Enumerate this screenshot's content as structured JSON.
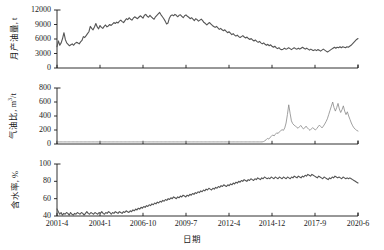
{
  "figure": {
    "background_color": "#ffffff",
    "line_color": "#555555",
    "axis_color": "#1a1a1a",
    "width": 384,
    "height": 250
  },
  "axis": {
    "xlabel": "日期",
    "xticks": [
      "2001-4",
      "2004-1",
      "2006-10",
      "2009-7",
      "2012-4",
      "2014-12",
      "2017-9",
      "2020-6"
    ]
  },
  "chart_data": [
    {
      "type": "line",
      "panel": 1,
      "title": "",
      "xlabel": "日期",
      "ylabel": "月产油量, t",
      "ylabel_text": "月产油量",
      "ylabel_unit": "t",
      "xlim": [
        "2001-4",
        "2020-6"
      ],
      "ylim": [
        0,
        12000
      ],
      "yticks": [
        "0",
        "3000",
        "6000",
        "9000",
        "12000"
      ],
      "ytick_values": [
        0,
        3000,
        6000,
        9000,
        12000
      ],
      "grid": false,
      "legend": "none",
      "series": [
        {
          "name": "月产油量",
          "color": "#555555",
          "values": [
            4400,
            5600,
            4700,
            5200,
            6100,
            7300,
            5900,
            5200,
            4900,
            4600,
            4800,
            5000,
            4700,
            5100,
            5300,
            5200,
            5000,
            5400,
            5700,
            6500,
            6300,
            6700,
            7100,
            7500,
            8600,
            8200,
            7900,
            8500,
            9200,
            8500,
            8100,
            8800,
            8400,
            8200,
            8600,
            8900,
            8500,
            8700,
            9000,
            8800,
            9100,
            9400,
            9200,
            9500,
            9300,
            9700,
            9900,
            9600,
            9400,
            9800,
            10200,
            10000,
            10400,
            10100,
            9900,
            10300,
            10600,
            10400,
            10200,
            10500,
            10800,
            10600,
            10300,
            10900,
            11100,
            10700,
            10500,
            10900,
            10600,
            10300,
            10100,
            10600,
            10900,
            11200,
            11500,
            11000,
            10600,
            10200,
            9700,
            9100,
            9300,
            10300,
            10800,
            11000,
            10800,
            11100,
            10900,
            10600,
            10900,
            11000,
            10700,
            10400,
            10800,
            11000,
            10700,
            10500,
            10200,
            10400,
            10100,
            9800,
            10200,
            10000,
            9700,
            9900,
            10100,
            9800,
            9400,
            9200,
            8900,
            9200,
            9400,
            9100,
            8800,
            8600,
            8400,
            8600,
            8300,
            8000,
            8200,
            7900,
            7700,
            7900,
            7600,
            7300,
            7500,
            7200,
            6900,
            7100,
            6800,
            6600,
            6800,
            6500,
            6300,
            6500,
            6700,
            6400,
            6200,
            6400,
            6100,
            5900,
            6100,
            5800,
            5600,
            5800,
            5500,
            5300,
            5500,
            5200,
            5000,
            5200,
            4900,
            4700,
            4900,
            4600,
            4800,
            4500,
            4300,
            4500,
            4200,
            4000,
            4200,
            3900,
            3800,
            3900,
            4100,
            3900,
            4000,
            4200,
            4000,
            3800,
            4000,
            4200,
            4000,
            3900,
            4100,
            3900,
            4100,
            4300,
            4100,
            3900,
            4100,
            3900,
            3700,
            3900,
            3700,
            3600,
            3800,
            3600,
            3800,
            3700,
            3500,
            3700,
            3900,
            3700,
            3500,
            3300,
            3500,
            3700,
            3900,
            4100,
            4300,
            4100,
            4300,
            4200,
            4400,
            4200,
            4400,
            4300,
            4200,
            4400,
            4300,
            4500,
            4700,
            5000,
            5300,
            5600,
            5900,
            6100
          ]
        }
      ]
    },
    {
      "type": "line",
      "panel": 2,
      "title": "",
      "xlabel": "日期",
      "ylabel": "气油比, m3/t",
      "ylabel_text": "气油比",
      "ylabel_unit": "m3/t",
      "xlim": [
        "2001-4",
        "2020-6"
      ],
      "ylim": [
        0,
        800
      ],
      "yticks": [
        "0",
        "200",
        "400",
        "600",
        "800"
      ],
      "ytick_values": [
        0,
        200,
        400,
        600,
        800
      ],
      "grid": false,
      "legend": "none",
      "series": [
        {
          "name": "气油比",
          "color": "#888888",
          "values": [
            30,
            30,
            30,
            30,
            30,
            30,
            30,
            30,
            30,
            30,
            30,
            30,
            30,
            30,
            30,
            30,
            30,
            30,
            30,
            30,
            30,
            30,
            30,
            30,
            30,
            30,
            30,
            30,
            30,
            30,
            30,
            30,
            30,
            30,
            30,
            30,
            30,
            30,
            30,
            30,
            30,
            30,
            30,
            30,
            30,
            30,
            30,
            30,
            30,
            30,
            30,
            30,
            30,
            30,
            30,
            30,
            30,
            30,
            30,
            30,
            30,
            30,
            30,
            30,
            30,
            30,
            30,
            30,
            30,
            30,
            30,
            30,
            30,
            30,
            30,
            30,
            30,
            30,
            30,
            30,
            30,
            30,
            30,
            30,
            30,
            30,
            30,
            30,
            30,
            30,
            30,
            30,
            30,
            30,
            30,
            30,
            30,
            30,
            30,
            30,
            30,
            30,
            30,
            30,
            30,
            30,
            30,
            30,
            30,
            30,
            30,
            30,
            30,
            30,
            30,
            30,
            30,
            30,
            30,
            30,
            30,
            30,
            30,
            30,
            30,
            30,
            30,
            30,
            30,
            30,
            30,
            30,
            30,
            30,
            30,
            30,
            30,
            30,
            30,
            30,
            30,
            30,
            30,
            30,
            30,
            30,
            30,
            30,
            30,
            30,
            30,
            30,
            30,
            30,
            30,
            35,
            45,
            60,
            80,
            70,
            95,
            110,
            130,
            115,
            140,
            160,
            150,
            175,
            190,
            205,
            195,
            230,
            300,
            420,
            560,
            440,
            330,
            290,
            270,
            255,
            240,
            225,
            245,
            265,
            240,
            215,
            230,
            255,
            230,
            210,
            195,
            215,
            235,
            215,
            200,
            220,
            245,
            270,
            250,
            230,
            255,
            285,
            320,
            360,
            420,
            480,
            540,
            600,
            520,
            470,
            520,
            580,
            500,
            450,
            490,
            545,
            470,
            420,
            460,
            400,
            350,
            300,
            260,
            230,
            210,
            195,
            185
          ]
        }
      ]
    },
    {
      "type": "line",
      "panel": 3,
      "title": "",
      "xlabel": "日期",
      "ylabel": "含水率, %",
      "ylabel_text": "含水率",
      "ylabel_unit": "%",
      "xlim": [
        "2001-4",
        "2020-6"
      ],
      "ylim": [
        40,
        100
      ],
      "yticks": [
        "40",
        "60",
        "80",
        "100"
      ],
      "ytick_values": [
        40,
        60,
        80,
        100
      ],
      "grid": false,
      "legend": "none",
      "series": [
        {
          "name": "含水率",
          "color": "#555555",
          "values": [
            48,
            45,
            42,
            44,
            41,
            43,
            42,
            44,
            43,
            41,
            44,
            42,
            41,
            43,
            42,
            44,
            43,
            42,
            44,
            43,
            41,
            43,
            45,
            43,
            42,
            44,
            43,
            42,
            44,
            43,
            42,
            44,
            43,
            45,
            43,
            42,
            44,
            43,
            45,
            44,
            42,
            44,
            43,
            45,
            44,
            43,
            45,
            44,
            43,
            45,
            44,
            46,
            45,
            44,
            46,
            45,
            47,
            46,
            48,
            47,
            49,
            48,
            50,
            49,
            51,
            50,
            52,
            51,
            53,
            52,
            54,
            53,
            55,
            54,
            56,
            55,
            57,
            56,
            58,
            57,
            59,
            58,
            60,
            59,
            61,
            60,
            62,
            61,
            60,
            62,
            61,
            63,
            62,
            64,
            63,
            62,
            64,
            63,
            65,
            64,
            66,
            65,
            67,
            66,
            68,
            67,
            69,
            68,
            70,
            69,
            71,
            70,
            72,
            71,
            70,
            72,
            71,
            73,
            72,
            74,
            73,
            75,
            74,
            76,
            75,
            74,
            76,
            75,
            77,
            76,
            78,
            77,
            79,
            78,
            80,
            79,
            81,
            80,
            82,
            81,
            80,
            82,
            81,
            83,
            82,
            81,
            83,
            82,
            84,
            83,
            82,
            84,
            83,
            85,
            84,
            83,
            84,
            83,
            85,
            84,
            83,
            85,
            84,
            83,
            85,
            84,
            83,
            85,
            84,
            83,
            85,
            84,
            83,
            85,
            84,
            86,
            85,
            84,
            86,
            85,
            84,
            86,
            85,
            87,
            86,
            88,
            87,
            86,
            88,
            87,
            86,
            85,
            84,
            86,
            85,
            84,
            83,
            85,
            84,
            83,
            82,
            84,
            83,
            85,
            84,
            86,
            85,
            84,
            85,
            84,
            83,
            85,
            84,
            83,
            84,
            83,
            84,
            83,
            82,
            81,
            80,
            79,
            78
          ]
        }
      ]
    }
  ]
}
